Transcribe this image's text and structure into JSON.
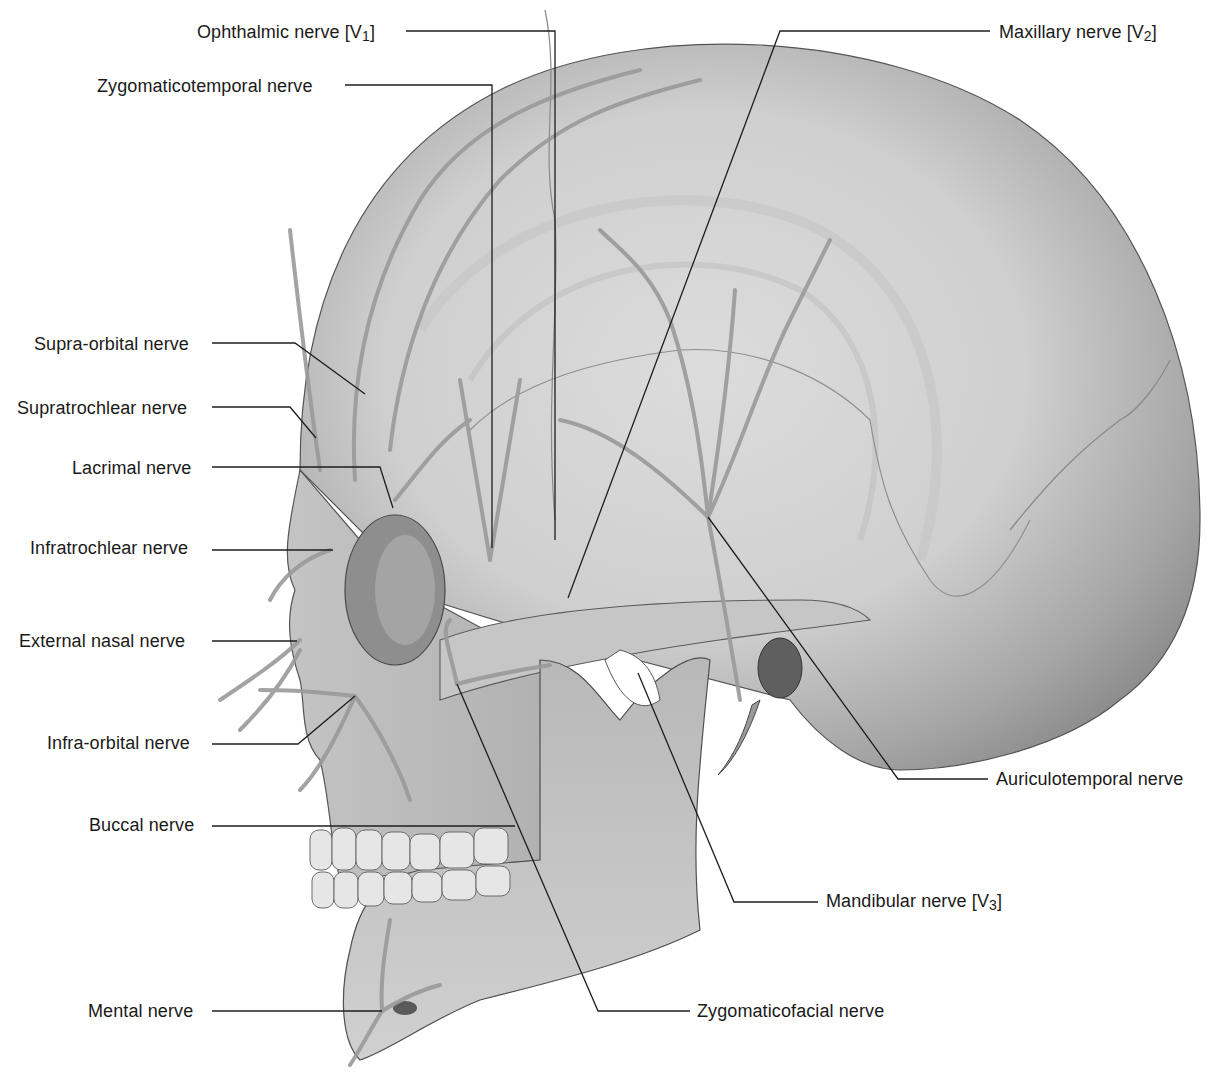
{
  "figure": {
    "colors": {
      "background": "#ffffff",
      "bone_light": "#d8d8d8",
      "bone_mid": "#b4b4b4",
      "bone_dark": "#7a7a7a",
      "nerve": "#9a9a9a",
      "leader_line": "#1e1e1e",
      "label_text": "#1a1a1a"
    },
    "labels": [
      {
        "id": "ophthalmic",
        "text": "Ophthalmic nerve [V",
        "sub": "1",
        "close": "]",
        "x": 197,
        "y": 21,
        "side": "left"
      },
      {
        "id": "maxillary",
        "text": "Maxillary nerve [V",
        "sub": "2",
        "close": "]",
        "x": 999,
        "y": 21,
        "side": "right"
      },
      {
        "id": "zygomaticotemporal",
        "text": "Zygomaticotemporal nerve",
        "sub": "",
        "close": "",
        "x": 97,
        "y": 75,
        "side": "left"
      },
      {
        "id": "supraorbital",
        "text": "Supra-orbital nerve",
        "sub": "",
        "close": "",
        "x": 34,
        "y": 333,
        "side": "left"
      },
      {
        "id": "supratrochlear",
        "text": "Supratrochlear nerve",
        "sub": "",
        "close": "",
        "x": 17,
        "y": 397,
        "side": "left"
      },
      {
        "id": "lacrimal",
        "text": "Lacrimal nerve",
        "sub": "",
        "close": "",
        "x": 72,
        "y": 457,
        "side": "left"
      },
      {
        "id": "infratrochlear",
        "text": "Infratrochlear nerve",
        "sub": "",
        "close": "",
        "x": 30,
        "y": 537,
        "side": "left"
      },
      {
        "id": "external_nasal",
        "text": "External nasal nerve",
        "sub": "",
        "close": "",
        "x": 19,
        "y": 630,
        "side": "left"
      },
      {
        "id": "infraorbital",
        "text": "Infra-orbital nerve",
        "sub": "",
        "close": "",
        "x": 47,
        "y": 732,
        "side": "left"
      },
      {
        "id": "auriculotemporal",
        "text": "Auriculotemporal nerve",
        "sub": "",
        "close": "",
        "x": 996,
        "y": 768,
        "side": "right"
      },
      {
        "id": "buccal",
        "text": "Buccal nerve",
        "sub": "",
        "close": "",
        "x": 89,
        "y": 814,
        "side": "left"
      },
      {
        "id": "mandibular",
        "text": "Mandibular nerve [V",
        "sub": "3",
        "close": "]",
        "x": 826,
        "y": 890,
        "side": "right"
      },
      {
        "id": "mental",
        "text": "Mental nerve",
        "sub": "",
        "close": "",
        "x": 88,
        "y": 1000,
        "side": "left"
      },
      {
        "id": "zygomaticofacial",
        "text": "Zygomaticofacial nerve",
        "sub": "",
        "close": "",
        "x": 697,
        "y": 1000,
        "side": "right"
      }
    ],
    "leaders": [
      {
        "id": "ophthalmic",
        "points": "406,31 555,31 555,540"
      },
      {
        "id": "maxillary",
        "points": "990,31 780,31 568,598"
      },
      {
        "id": "zygomaticotemporal",
        "points": "345,85 492,85 492,548"
      },
      {
        "id": "supraorbital",
        "points": "212,343 295,343 365,394"
      },
      {
        "id": "supratrochlear",
        "points": "212,407 290,407 316,438"
      },
      {
        "id": "lacrimal",
        "points": "212,467 380,467 393,508"
      },
      {
        "id": "infratrochlear",
        "points": "212,550 333,550"
      },
      {
        "id": "external_nasal",
        "points": "212,641 297,641"
      },
      {
        "id": "infraorbital",
        "points": "212,744 298,744 355,696"
      },
      {
        "id": "auriculotemporal",
        "points": "988,779 898,779 708,517"
      },
      {
        "id": "buccal",
        "points": "212,826 515,826"
      },
      {
        "id": "mandibular",
        "points": "818,902 734,902 638,673"
      },
      {
        "id": "mental",
        "points": "212,1011 382,1011"
      },
      {
        "id": "zygomaticofacial",
        "points": "690,1011 598,1011 457,684"
      }
    ]
  }
}
